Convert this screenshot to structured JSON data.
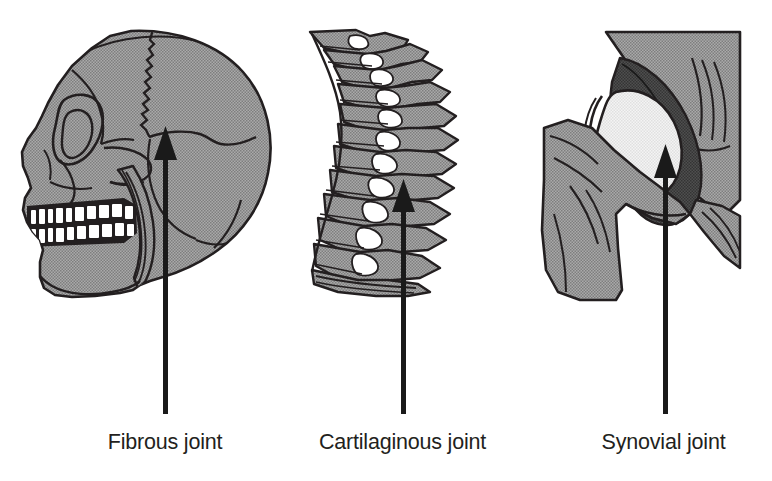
{
  "figure": {
    "background_color": "#ffffff",
    "line_color": "#231f20",
    "bone_fill": "#9a9a9a",
    "bone_fill_light": "#ededed",
    "bone_fill_dark": "#4d4d4d",
    "tooth_fill": "#ffffff",
    "arrow_color": "#1a1a1a"
  },
  "panels": [
    {
      "id": "fibrous",
      "caption": "Fibrous joint",
      "illustration": "lateral-skull",
      "illustration_name": "skull-lateral-view",
      "joint_feature": "cranial suture",
      "arrow": {
        "tip_x": 166,
        "tip_y": 127,
        "tail_y": 413
      }
    },
    {
      "id": "cartilaginous",
      "caption": "Cartilaginous joint",
      "illustration": "vertebral-column",
      "illustration_name": "vertebral-column-lateral-view",
      "joint_feature": "intervertebral disc",
      "arrow": {
        "tip_x": 404,
        "tip_y": 180,
        "tail_y": 413
      }
    },
    {
      "id": "synovial",
      "caption": "Synovial joint",
      "illustration": "hip-joint",
      "illustration_name": "hip-joint-coronal-view",
      "joint_feature": "hip joint cavity",
      "arrow": {
        "tip_x": 665,
        "tip_y": 145,
        "tail_y": 413
      }
    }
  ]
}
